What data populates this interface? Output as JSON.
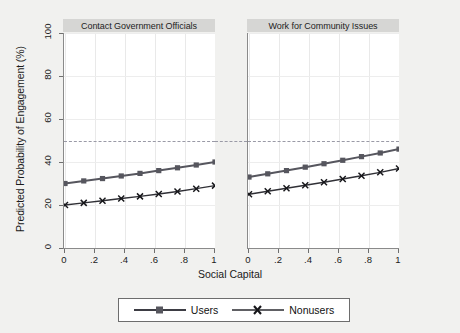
{
  "chart_data": {
    "type": "line",
    "title": "",
    "xlabel": "Social Capital",
    "ylabel": "Predicted Probability of Engagement (%)",
    "xlim": [
      0,
      1
    ],
    "ylim": [
      0,
      100
    ],
    "xticks": [
      0,
      0.2,
      0.4,
      0.6,
      0.8,
      1
    ],
    "xtick_labels": [
      "0",
      ".2",
      ".4",
      ".6",
      ".8",
      "1"
    ],
    "yticks": [
      0,
      20,
      40,
      60,
      80,
      100
    ],
    "ytick_labels": [
      "0",
      "20",
      "40",
      "60",
      "80",
      "100"
    ],
    "grid": true,
    "legend_position": "bottom",
    "reference_line": {
      "y": 50,
      "style": "dashed",
      "color": "#9a9aa6"
    },
    "x": [
      0,
      0.125,
      0.25,
      0.375,
      0.5,
      0.625,
      0.75,
      0.875,
      1
    ],
    "panels": [
      {
        "title": "Contact Government Officials",
        "series": [
          {
            "name": "Users",
            "marker": "square",
            "color": "#56565e",
            "values": [
              30.0,
              31.2,
              32.3,
              33.5,
              34.7,
              36.0,
              37.3,
              38.6,
              40.0
            ]
          },
          {
            "name": "Nonusers",
            "marker": "x",
            "color": "#303036",
            "values": [
              20.0,
              21.0,
              22.0,
              23.0,
              24.0,
              25.1,
              26.3,
              27.6,
              29.0
            ]
          }
        ]
      },
      {
        "title": "Work for Community Issues",
        "series": [
          {
            "name": "Users",
            "marker": "square",
            "color": "#56565e",
            "values": [
              33.0,
              34.5,
              36.0,
              37.6,
              39.2,
              40.8,
              42.5,
              44.2,
              46.0
            ]
          },
          {
            "name": "Nonusers",
            "marker": "x",
            "color": "#303036",
            "values": [
              25.0,
              26.4,
              27.8,
              29.2,
              30.6,
              32.1,
              33.6,
              35.2,
              37.0
            ]
          }
        ]
      }
    ],
    "legend": [
      {
        "label": "Users",
        "marker": "square"
      },
      {
        "label": "Nonusers",
        "marker": "x"
      }
    ]
  }
}
